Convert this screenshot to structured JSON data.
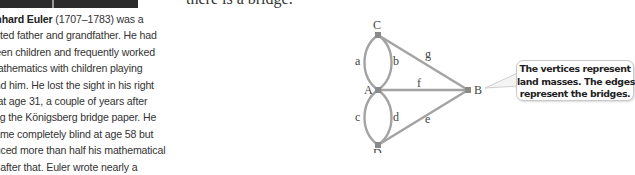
{
  "photo": {
    "caption_visible": false
  },
  "top_text": "there is a bridge.",
  "bio": {
    "name": "onhard Euler",
    "dates": "(1707–1783)",
    "lines": [
      " was a",
      "voted father and grandfather. He had",
      "rteen children and frequently worked",
      "mathematics with children playing",
      "und him. He lost the sight in his right",
      "e at age 31, a couple of years after",
      "ting the Königsberg bridge paper. He",
      "came completely blind at age 58 but",
      "duced more than half his mathematical",
      "rk after that. Euler wrote nearly a"
    ]
  },
  "graph": {
    "vertices": [
      {
        "id": "C",
        "x": 378,
        "y": 35
      },
      {
        "id": "A",
        "x": 378,
        "y": 90
      },
      {
        "id": "D",
        "x": 378,
        "y": 145
      },
      {
        "id": "B",
        "x": 468,
        "y": 90
      }
    ],
    "edges": [
      {
        "label": "a",
        "from": "C",
        "to": "A"
      },
      {
        "label": "b",
        "from": "C",
        "to": "A"
      },
      {
        "label": "c",
        "from": "A",
        "to": "D"
      },
      {
        "label": "d",
        "from": "A",
        "to": "D"
      },
      {
        "label": "e",
        "from": "D",
        "to": "B"
      },
      {
        "label": "f",
        "from": "A",
        "to": "B"
      },
      {
        "label": "g",
        "from": "C",
        "to": "B"
      }
    ],
    "edge_color": "#9a9a9a",
    "vertex_color": "#8a8a8a"
  },
  "callout": {
    "lines": [
      "The vertices represent",
      "land masses. The edges",
      "represent the bridges."
    ]
  }
}
